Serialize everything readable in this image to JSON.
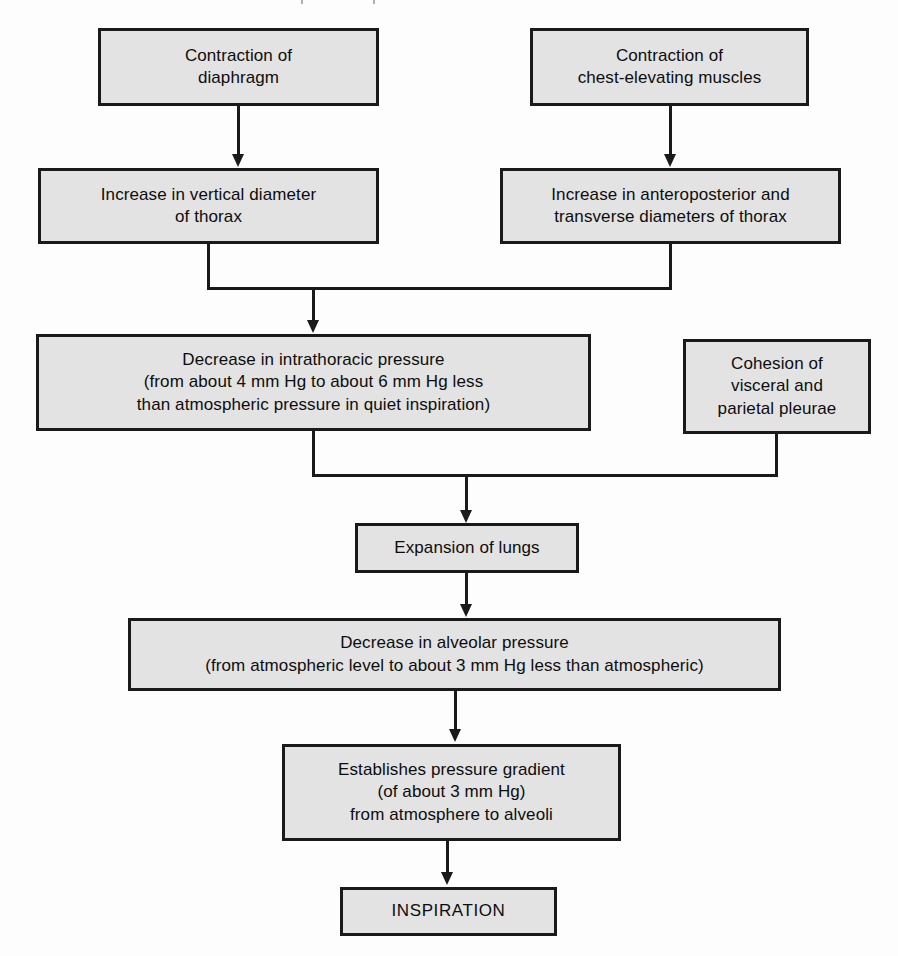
{
  "diagram": {
    "type": "flowchart",
    "orientation": "top-to-bottom",
    "style": {
      "node_fill": "#e3e3e3",
      "node_border": "#1a1a1a",
      "connector_color": "#1a1a1a",
      "background": "#fdfdfd",
      "text_color": "#0d0d0d"
    },
    "nodes": [
      {
        "id": "contraction-of-diaphragm",
        "label": "Contraction of\ndiaphragm",
        "x": 98,
        "y": 28,
        "w": 281,
        "h": 78
      },
      {
        "id": "contraction-of-chest-elevating-muscles",
        "label": "Contraction of\nchest-elevating muscles",
        "x": 530,
        "y": 28,
        "w": 279,
        "h": 78
      },
      {
        "id": "increase-in-vertical-diameter-of-thorax",
        "label": "Increase in vertical diameter\nof thorax",
        "x": 38,
        "y": 168,
        "w": 341,
        "h": 76
      },
      {
        "id": "increase-in-anteroposterior-and-transverse-diameters",
        "label": "Increase in anteroposterior and\ntransverse diameters of thorax",
        "x": 500,
        "y": 168,
        "w": 341,
        "h": 76
      },
      {
        "id": "decrease-in-intrathoracic-pressure",
        "label": "Decrease in intrathoracic pressure\n(from about 4 mm Hg to about 6 mm Hg less\nthan atmospheric pressure in quiet inspiration)",
        "x": 36,
        "y": 334,
        "w": 555,
        "h": 97
      },
      {
        "id": "cohesion-of-visceral-and-parietal-pleurae",
        "label": "Cohesion of\nvisceral and\nparietal pleurae",
        "x": 683,
        "y": 339,
        "w": 188,
        "h": 95
      },
      {
        "id": "expansion-of-lungs",
        "label": "Expansion of lungs",
        "x": 355,
        "y": 523,
        "w": 224,
        "h": 50
      },
      {
        "id": "decrease-in-alveolar-pressure",
        "label": "Decrease in alveolar pressure\n(from atmospheric level to about 3 mm Hg less than atmospheric)",
        "x": 128,
        "y": 618,
        "w": 653,
        "h": 73
      },
      {
        "id": "establishes-pressure-gradient",
        "label": "Establishes pressure gradient\n(of about 3 mm Hg)\nfrom atmosphere to alveoli",
        "x": 282,
        "y": 744,
        "w": 339,
        "h": 97
      },
      {
        "id": "inspiration",
        "label": "INSPIRATION",
        "x": 340,
        "y": 887,
        "w": 217,
        "h": 49
      }
    ],
    "edges": [
      {
        "id": "edge-diaphragm-to-vertical-diameter",
        "from": "contraction-of-diaphragm",
        "to": "increase-in-vertical-diameter-of-thorax",
        "arrow": true
      },
      {
        "id": "edge-chest-muscles-to-ap-transverse",
        "from": "contraction-of-chest-elevating-muscles",
        "to": "increase-in-anteroposterior-and-transverse-diameters",
        "arrow": true
      },
      {
        "id": "edge-thorax-merge-to-intrathoracic-pressure",
        "from": "increase-in-vertical-diameter-of-thorax + increase-in-anteroposterior-and-transverse-diameters",
        "to": "decrease-in-intrathoracic-pressure",
        "arrow": true,
        "merge": true
      },
      {
        "id": "edge-pressure-cohesion-merge-to-expansion",
        "from": "decrease-in-intrathoracic-pressure + cohesion-of-visceral-and-parietal-pleurae",
        "to": "expansion-of-lungs",
        "arrow": true,
        "merge": true
      },
      {
        "id": "edge-expansion-to-alveolar-pressure",
        "from": "expansion-of-lungs",
        "to": "decrease-in-alveolar-pressure",
        "arrow": true
      },
      {
        "id": "edge-alveolar-to-gradient",
        "from": "decrease-in-alveolar-pressure",
        "to": "establishes-pressure-gradient",
        "arrow": true
      },
      {
        "id": "edge-gradient-to-inspiration",
        "from": "establishes-pressure-gradient",
        "to": "inspiration",
        "arrow": true
      }
    ]
  }
}
